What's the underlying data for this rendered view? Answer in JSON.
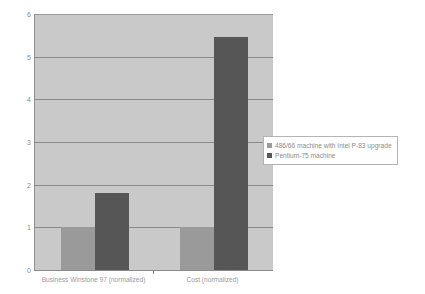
{
  "chart_data": {
    "type": "bar",
    "title": "",
    "xlabel": "",
    "ylabel": "r",
    "categories": [
      "Business Winstone 97 (normalized)",
      "Cost (normalized)"
    ],
    "series": [
      {
        "name": "486/66 machine with Intel P-83 upgrade",
        "color": "#9a9a9a",
        "values": [
          1.0,
          1.0
        ]
      },
      {
        "name": "Pentium-75 machine",
        "color": "#565656",
        "values": [
          1.8,
          5.45
        ]
      }
    ],
    "ylim": [
      0,
      6
    ],
    "yticks": [
      0,
      1,
      2,
      3,
      4,
      5,
      6
    ],
    "ytick_labels": [
      "0",
      "1",
      "2",
      "3",
      "4",
      "5",
      "6"
    ],
    "grid": true,
    "legend_position": "right",
    "plot_background": "#c9c9c9"
  }
}
